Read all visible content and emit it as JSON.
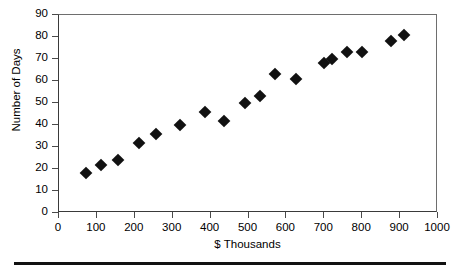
{
  "chart_data": {
    "type": "scatter",
    "title": "",
    "xlabel": "$ Thousands",
    "ylabel": "Number of Days",
    "xlim": [
      0,
      1000
    ],
    "ylim": [
      0,
      90
    ],
    "xticks": [
      0,
      100,
      200,
      300,
      400,
      500,
      600,
      700,
      800,
      900,
      1000
    ],
    "yticks": [
      0,
      10,
      20,
      30,
      40,
      50,
      60,
      70,
      80,
      90
    ],
    "grid": false,
    "legend": null,
    "marker": "diamond",
    "marker_color": "#111111",
    "points": [
      {
        "x": 70,
        "y": 18
      },
      {
        "x": 110,
        "y": 22
      },
      {
        "x": 155,
        "y": 24
      },
      {
        "x": 210,
        "y": 32
      },
      {
        "x": 255,
        "y": 36
      },
      {
        "x": 320,
        "y": 40
      },
      {
        "x": 385,
        "y": 46
      },
      {
        "x": 435,
        "y": 42
      },
      {
        "x": 490,
        "y": 50
      },
      {
        "x": 530,
        "y": 53
      },
      {
        "x": 570,
        "y": 63
      },
      {
        "x": 625,
        "y": 61
      },
      {
        "x": 700,
        "y": 68
      },
      {
        "x": 720,
        "y": 70
      },
      {
        "x": 760,
        "y": 73
      },
      {
        "x": 800,
        "y": 73
      },
      {
        "x": 875,
        "y": 78
      },
      {
        "x": 910,
        "y": 81
      }
    ]
  }
}
